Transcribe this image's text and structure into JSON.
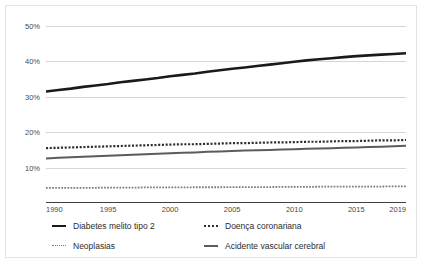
{
  "chart_data": {
    "type": "line",
    "title": "",
    "xlabel": "",
    "ylabel": "",
    "xlim": [
      1990,
      2019
    ],
    "ylim": [
      0,
      50
    ],
    "grid": true,
    "legend_position": "bottom",
    "y_ticks": [
      "10%",
      "20%",
      "30%",
      "40%",
      "50%"
    ],
    "y_tick_values": [
      10,
      20,
      30,
      40,
      50
    ],
    "x_ticks": [
      "1990",
      "1995",
      "2000",
      "2005",
      "2010",
      "2015",
      "2019"
    ],
    "x_tick_values": [
      1990,
      1995,
      2000,
      2005,
      2010,
      2015,
      2019
    ],
    "x": [
      1990,
      1991,
      1992,
      1993,
      1994,
      1995,
      1996,
      1997,
      1998,
      1999,
      2000,
      2001,
      2002,
      2003,
      2004,
      2005,
      2006,
      2007,
      2008,
      2009,
      2010,
      2011,
      2012,
      2013,
      2014,
      2015,
      2016,
      2017,
      2018,
      2019
    ],
    "series": [
      {
        "name": "Diabetes melito tipo 2",
        "style": "solid",
        "color": "#1a1a1a",
        "width": 2.6,
        "values": [
          31.5,
          31.9,
          32.3,
          32.8,
          33.2,
          33.6,
          34.1,
          34.5,
          34.9,
          35.3,
          35.8,
          36.2,
          36.6,
          37.1,
          37.5,
          37.9,
          38.3,
          38.7,
          39.1,
          39.5,
          39.9,
          40.3,
          40.6,
          40.9,
          41.2,
          41.5,
          41.7,
          41.9,
          42.1,
          42.3
        ]
      },
      {
        "name": "Doença coronariana",
        "style": "dotted",
        "color": "#2e2e2e",
        "width": 2.2,
        "values": [
          15.5,
          15.6,
          15.7,
          15.8,
          15.9,
          16.0,
          16.1,
          16.2,
          16.3,
          16.4,
          16.5,
          16.6,
          16.6,
          16.7,
          16.8,
          16.9,
          16.9,
          17.0,
          17.1,
          17.1,
          17.2,
          17.3,
          17.3,
          17.4,
          17.5,
          17.5,
          17.6,
          17.7,
          17.7,
          17.8
        ]
      },
      {
        "name": "Neoplasias",
        "style": "dotted",
        "color": "#7a7a7a",
        "width": 1.8,
        "values": [
          4.3,
          4.3,
          4.3,
          4.3,
          4.3,
          4.35,
          4.35,
          4.35,
          4.4,
          4.4,
          4.4,
          4.4,
          4.45,
          4.45,
          4.45,
          4.5,
          4.5,
          4.5,
          4.5,
          4.55,
          4.55,
          4.55,
          4.6,
          4.6,
          4.6,
          4.6,
          4.65,
          4.65,
          4.7,
          4.7
        ]
      },
      {
        "name": "Acidente vascular cerebral",
        "style": "solid",
        "color": "#5c5c5c",
        "width": 2.0,
        "values": [
          12.6,
          12.75,
          12.9,
          13.05,
          13.2,
          13.35,
          13.5,
          13.65,
          13.8,
          13.9,
          14.05,
          14.2,
          14.3,
          14.45,
          14.55,
          14.7,
          14.8,
          14.9,
          15.0,
          15.1,
          15.2,
          15.3,
          15.4,
          15.5,
          15.6,
          15.7,
          15.8,
          15.9,
          16.05,
          16.2
        ]
      }
    ]
  },
  "legend": {
    "items": [
      {
        "label": "Diabetes melito tipo 2"
      },
      {
        "label": "Doença coronariana"
      },
      {
        "label": "Neoplasias"
      },
      {
        "label": "Acidente vascular cerebral"
      }
    ]
  },
  "colors": {
    "gridline": "#d6d6d6",
    "axis": "#3f3f3f",
    "border": "#e2e2e2",
    "background": "#ffffff",
    "tick_text": "#4a4a4a",
    "legend_text": "#2b2b2b"
  }
}
